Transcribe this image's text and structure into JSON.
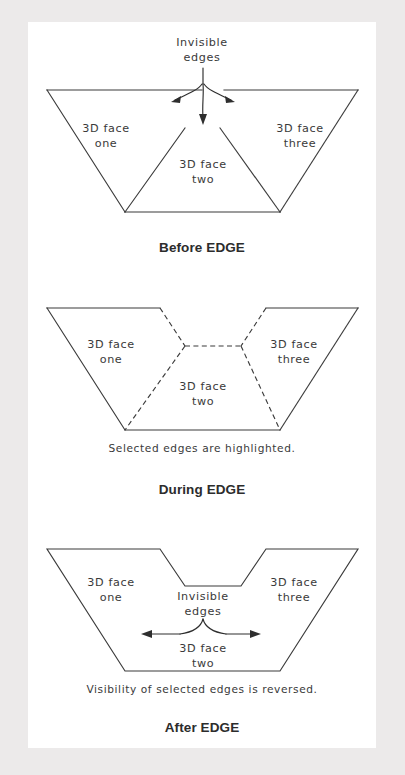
{
  "figure": {
    "title_semantic": "edge-command-illustration",
    "background_color": "#eceaea",
    "paper_color": "#ffffff",
    "line_color": "#3b3b3b"
  },
  "panels": [
    {
      "id": "before-edge",
      "caption": "Before EDGE",
      "callout": {
        "line1": "Invisible",
        "line2": "edges"
      },
      "faces": [
        {
          "line1": "3D face",
          "line2": "one"
        },
        {
          "line1": "3D face",
          "line2": "two"
        },
        {
          "line1": "3D face",
          "line2": "three"
        }
      ],
      "note": "",
      "edge_style": "solid",
      "arrows": 3
    },
    {
      "id": "during-edge",
      "caption": "During EDGE",
      "callout": {
        "line1": "",
        "line2": ""
      },
      "faces": [
        {
          "line1": "3D face",
          "line2": "one"
        },
        {
          "line1": "3D face",
          "line2": "two"
        },
        {
          "line1": "3D face",
          "line2": "three"
        }
      ],
      "note": "Selected edges are highlighted.",
      "edge_style": "dashed",
      "arrows": 0
    },
    {
      "id": "after-edge",
      "caption": "After EDGE",
      "callout": {
        "line1": "Invisible",
        "line2": "edges"
      },
      "faces": [
        {
          "line1": "3D face",
          "line2": "one"
        },
        {
          "line1": "3D face",
          "line2": "two"
        },
        {
          "line1": "3D face",
          "line2": "three"
        }
      ],
      "note": "Visibility of selected edges is reversed.",
      "edge_style": "hidden",
      "arrows": 2
    }
  ]
}
